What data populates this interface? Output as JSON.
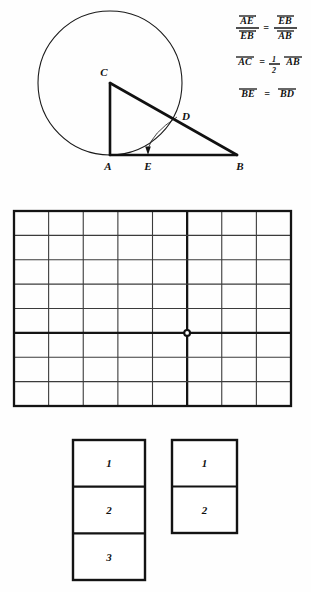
{
  "page": {
    "background_color": "#fefefe",
    "ink_color": "#141414",
    "width": 311,
    "height": 592
  },
  "figure_top": {
    "name": "circle-triangle-figure",
    "points": [
      {
        "id": "A",
        "label": "A",
        "x": 110,
        "y": 155,
        "desc": "bottom-left vertex of triangle, on circle"
      },
      {
        "id": "B",
        "label": "B",
        "x": 237,
        "y": 155,
        "desc": "right vertex of triangle on baseline"
      },
      {
        "id": "C",
        "label": "C",
        "x": 110,
        "y": 83,
        "desc": "apex of triangle, center of circle"
      },
      {
        "id": "D",
        "label": "D",
        "x": 177,
        "y": 117,
        "desc": "intersection of CB with circle"
      },
      {
        "id": "E",
        "label": "E",
        "x": 148,
        "y": 155,
        "desc": "point on AB, arc from D swung to AB"
      }
    ],
    "circle": {
      "cx": 110,
      "cy": 83,
      "r": 72
    },
    "segments": [
      {
        "from": "C",
        "to": "A"
      },
      {
        "from": "C",
        "to": "B"
      },
      {
        "from": "A",
        "to": "B"
      }
    ],
    "arc_annotation": {
      "from": "D",
      "to": "E",
      "arrowhead": "down"
    }
  },
  "equations": [
    {
      "id": "eq-proportion",
      "type": "fraction",
      "left": {
        "numerator": "AE",
        "denominator": "EB"
      },
      "relation": "=",
      "right": {
        "numerator": "EB",
        "denominator": "AB"
      },
      "plain": "AE/EB = EB/AB"
    },
    {
      "id": "eq-half",
      "type": "scalar-fraction",
      "left": "AC",
      "relation": "=",
      "coefficient": {
        "numerator": "1",
        "denominator": "2"
      },
      "right": "AB",
      "plain": "AC = 1/2 AB"
    },
    {
      "id": "eq-equal",
      "type": "simple",
      "left": "BE",
      "relation": "=",
      "right": "BD",
      "plain": "BE = BD"
    }
  ],
  "grid_figure": {
    "name": "rectangle-grid",
    "x": 14,
    "y": 211,
    "width": 277,
    "height": 195,
    "columns": 8,
    "rows": 8,
    "heavy_column_index": 5,
    "heavy_row_index": 5,
    "marker": {
      "label": "",
      "shape": "circle",
      "column_index": 5,
      "row_index": 5
    }
  },
  "boxes": [
    {
      "name": "left-box",
      "x": 73,
      "y": 440,
      "width": 72,
      "height": 140,
      "cells": [
        "1",
        "2",
        "3"
      ]
    },
    {
      "name": "right-box",
      "x": 172,
      "y": 440,
      "width": 65,
      "height": 93,
      "cells": [
        "1",
        "2"
      ]
    }
  ]
}
